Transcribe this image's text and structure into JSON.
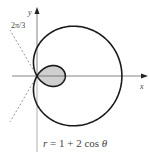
{
  "figure": {
    "equation_label": "r = 1 + 2 cos θ",
    "equation_parts": {
      "r": "r",
      "eq": " = 1 + 2 cos ",
      "theta": "θ"
    },
    "x_axis_label": "x",
    "y_axis_label": "y",
    "angle_label": "2π/3",
    "colors": {
      "curve": "#1a1a1a",
      "axis": "#555555",
      "axis_light": "#9a9a9a",
      "dashed": "#8a8a8a",
      "inner_loop_fill": "#cfcfcf",
      "background": "#ffffff"
    }
  },
  "chart_data": {
    "type": "polar-curve",
    "title": "",
    "equation": "r = 1 + 2cos(θ)",
    "curve": {
      "a": 1,
      "b": 2,
      "theta_range": [
        0,
        6.283185307
      ]
    },
    "shaded_region": "inner loop (2π/3 ≤ θ ≤ 4π/3)",
    "reference_lines": [
      {
        "angle": "2π/3",
        "style": "dashed"
      },
      {
        "angle": "4π/3",
        "style": "dashed"
      }
    ],
    "axes": {
      "x_label": "x",
      "y_label": "y",
      "origin_px": [
        37,
        76
      ],
      "scale_px_per_unit": 28.3
    },
    "annotations": [
      "2π/3",
      "r = 1 + 2 cos θ"
    ]
  }
}
